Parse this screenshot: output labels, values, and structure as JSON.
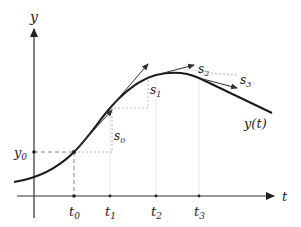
{
  "diagram": {
    "axes": {
      "x_label": "t",
      "y_label": "y"
    },
    "ticks": {
      "t0": "t",
      "t0_sub": "0",
      "t1": "t",
      "t1_sub": "1",
      "t2": "t",
      "t2_sub": "2",
      "t3": "t",
      "t3_sub": "3"
    },
    "y0": {
      "main": "y",
      "sub": "0"
    },
    "slopes": {
      "s0": {
        "main": "s",
        "sub": "0"
      },
      "s1": {
        "main": "s",
        "sub": "1"
      },
      "s2": {
        "main": "s",
        "sub": "2"
      },
      "s3": {
        "main": "s",
        "sub": "3"
      }
    },
    "curve_label": "y(t)",
    "colors": {
      "curve": "#1a1a1a",
      "axis": "#333333",
      "dashed": "#666666",
      "dotted": "#999999",
      "tangent": "#333333"
    }
  }
}
